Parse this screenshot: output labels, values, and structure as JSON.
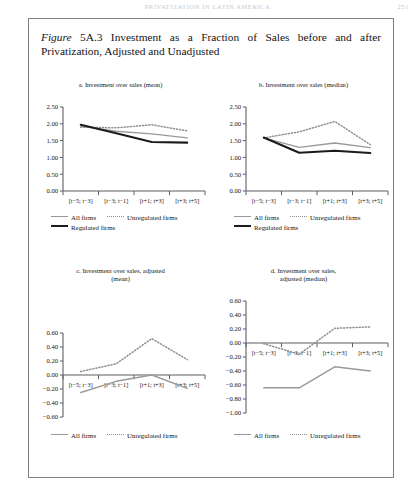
{
  "running_head": {
    "title": "PRIVATIZATION IN LATIN AMERICA",
    "page_number": "251"
  },
  "figure": {
    "label_word": "Figure",
    "label_number": "5A.3",
    "caption": "Investment as a Fraction of Sales before and after Privatization, Adjusted and Unadjusted"
  },
  "legend": {
    "all_firms": "All firms",
    "unregulated_firms": "Unregulated firms",
    "regulated_firms": "Regulated firms"
  },
  "colors": {
    "all_firms": "#9a9a9a",
    "unregulated_firms": "#8e8e8e",
    "regulated_firms": "#1c1c1c",
    "axis": "#5f5f66",
    "frame": "#7e7e86"
  },
  "chart_data": [
    {
      "id": "a",
      "type": "line",
      "title": "a. Investment over sales (mean)",
      "xlabel": "",
      "ylabel": "",
      "categories": [
        "[t−5; t−3]",
        "[t−3; t−1]",
        "[t+1; t+3]",
        "[t+3; t+5]"
      ],
      "yticks": [
        0.0,
        0.5,
        1.0,
        1.5,
        2.0,
        2.5
      ],
      "ytick_labels": [
        "0.00",
        "0.50",
        "1.00",
        "1.50",
        "2.00",
        "2.50"
      ],
      "ylim": [
        0.0,
        2.5
      ],
      "grid": false,
      "legend_position": "below",
      "series": [
        {
          "name": "All firms",
          "style": "solid-gray",
          "values": [
            1.93,
            1.78,
            1.7,
            1.58
          ]
        },
        {
          "name": "Unregulated firms",
          "style": "dotted",
          "values": [
            1.9,
            1.88,
            1.97,
            1.79
          ]
        },
        {
          "name": "Regulated firms",
          "style": "solid-black",
          "values": [
            1.97,
            1.72,
            1.46,
            1.44
          ]
        }
      ]
    },
    {
      "id": "b",
      "type": "line",
      "title": "b. Investment over sales (median)",
      "xlabel": "",
      "ylabel": "",
      "categories": [
        "[t−5; t−3]",
        "[t−3; t−1]",
        "[t+1; t+3]",
        "[t+3; t+5]"
      ],
      "yticks": [
        0.0,
        0.5,
        1.0,
        1.5,
        2.0,
        2.5
      ],
      "ytick_labels": [
        "0.00",
        "0.50",
        "1.00",
        "1.50",
        "2.00",
        "2.50"
      ],
      "ylim": [
        0.0,
        2.5
      ],
      "grid": false,
      "legend_position": "below",
      "series": [
        {
          "name": "All firms",
          "style": "solid-gray",
          "values": [
            1.58,
            1.3,
            1.43,
            1.29
          ]
        },
        {
          "name": "Unregulated firms",
          "style": "dotted",
          "values": [
            1.58,
            1.76,
            2.07,
            1.38
          ]
        },
        {
          "name": "Regulated firms",
          "style": "solid-black",
          "values": [
            1.59,
            1.14,
            1.2,
            1.13
          ]
        }
      ]
    },
    {
      "id": "c",
      "type": "line",
      "title": "c. Investment over sales, adjusted (mean)",
      "title_line1": "c. Investment over sales, adjusted",
      "title_line2": "(mean)",
      "xlabel": "",
      "ylabel": "",
      "categories": [
        "[t−5; t−3]",
        "[t−3; t−1]",
        "[t+1; t+3]",
        "[t+3; t+5]"
      ],
      "yticks": [
        -0.6,
        -0.4,
        -0.2,
        0.0,
        0.2,
        0.4,
        0.6
      ],
      "ytick_labels": [
        "−0.60",
        "−0.40",
        "−0.20",
        "0.00",
        "0.20",
        "0.40",
        "0.60"
      ],
      "ylim": [
        -0.6,
        0.6
      ],
      "grid": false,
      "legend_position": "below",
      "series": [
        {
          "name": "All firms",
          "style": "solid-gray",
          "values": [
            -0.25,
            -0.09,
            0.0,
            -0.19
          ]
        },
        {
          "name": "Unregulated firms",
          "style": "dotted",
          "values": [
            0.05,
            0.16,
            0.52,
            0.22
          ]
        }
      ]
    },
    {
      "id": "d",
      "type": "line",
      "title": "d. Investment over sales, adjusted (median)",
      "title_line1": "d. Investment over sales,",
      "title_line2": "adjusted (median)",
      "xlabel": "",
      "ylabel": "",
      "categories": [
        "[t−5; t−3]",
        "[t−3; t−1]",
        "[t+1; t+3]",
        "[t+3; t+5]"
      ],
      "yticks": [
        -1.0,
        -0.8,
        -0.6,
        -0.4,
        -0.2,
        0.0,
        0.2,
        0.4,
        0.6
      ],
      "ytick_labels": [
        "−1.00",
        "−0.80",
        "−0.60",
        "−0.40",
        "−0.20",
        "0.00",
        "0.20",
        "0.40",
        "0.60"
      ],
      "ylim": [
        -1.0,
        0.6
      ],
      "grid": false,
      "legend_position": "below",
      "series": [
        {
          "name": "All firms",
          "style": "solid-gray",
          "values": [
            -0.64,
            -0.64,
            -0.34,
            -0.4
          ]
        },
        {
          "name": "Unregulated firms",
          "style": "dotted",
          "values": [
            -0.01,
            -0.16,
            0.21,
            0.23
          ]
        }
      ]
    }
  ]
}
